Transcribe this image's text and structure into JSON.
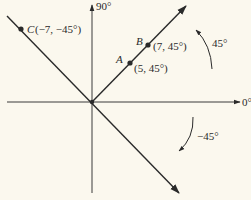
{
  "diagram": {
    "type": "polar-coordinates",
    "colors": {
      "background": "#fbf8ee",
      "ink": "#2a2a2a"
    },
    "axes": {
      "horizontal_label": "0°",
      "vertical_label": "90°"
    },
    "rays": [
      {
        "name": "ray-45",
        "angle_deg": 45
      },
      {
        "name": "ray-minus-45",
        "angle_deg": -45
      }
    ],
    "points": [
      {
        "id": "A",
        "label": "A",
        "coords": "(5, 45°)"
      },
      {
        "id": "B",
        "label": "B",
        "coords": "(7, 45°)"
      },
      {
        "id": "C",
        "label": "C",
        "coords": "(−7, −45°)"
      }
    ],
    "angle_arcs": [
      {
        "name": "arc-positive",
        "label": "45°",
        "direction": "counterclockwise"
      },
      {
        "name": "arc-negative",
        "label": "−45°",
        "direction": "clockwise"
      }
    ]
  }
}
